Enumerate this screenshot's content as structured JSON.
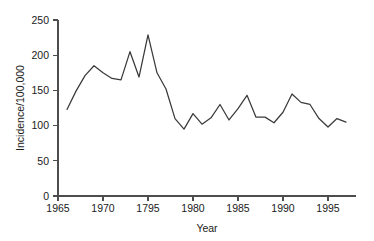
{
  "chart_data": {
    "type": "line",
    "title": "",
    "subtitle": "",
    "xlabel": "Year",
    "ylabel": "Incidence/100,000",
    "xlim": [
      1965,
      1998
    ],
    "ylim": [
      0,
      250
    ],
    "grid": false,
    "legend": false,
    "legend_position": "none",
    "line_color": "#3a3a3a",
    "axis_color": "#4d4d4d",
    "x_tick_labels": [
      "1965",
      "1970",
      "1795",
      "1980",
      "1985",
      "1990",
      "1995"
    ],
    "x_tick_values": [
      1965,
      1970,
      1975,
      1980,
      1985,
      1990,
      1995
    ],
    "y_tick_labels": [
      "0",
      "50",
      "100",
      "150",
      "200",
      "250"
    ],
    "y_tick_values": [
      0,
      50,
      100,
      150,
      200,
      250
    ],
    "x": [
      1966,
      1967,
      1968,
      1969,
      1970,
      1971,
      1972,
      1973,
      1974,
      1975,
      1976,
      1977,
      1978,
      1979,
      1980,
      1981,
      1982,
      1983,
      1984,
      1985,
      1986,
      1987,
      1988,
      1989,
      1990,
      1991,
      1992,
      1993,
      1994,
      1995,
      1996,
      1997
    ],
    "values": [
      123,
      149,
      171,
      185,
      175,
      167,
      165,
      205,
      169,
      229,
      175,
      152,
      110,
      95,
      117,
      102,
      111,
      130,
      108,
      124,
      143,
      112,
      112,
      104,
      119,
      145,
      133,
      130,
      110,
      98,
      110,
      105
    ],
    "series": [
      {
        "name": "Incidence/100,000",
        "values": [
          123,
          149,
          171,
          185,
          175,
          167,
          165,
          205,
          169,
          229,
          175,
          152,
          110,
          95,
          117,
          102,
          111,
          130,
          108,
          124,
          143,
          112,
          112,
          104,
          119,
          145,
          133,
          130,
          110,
          98,
          110,
          105
        ]
      }
    ],
    "annotations": []
  }
}
